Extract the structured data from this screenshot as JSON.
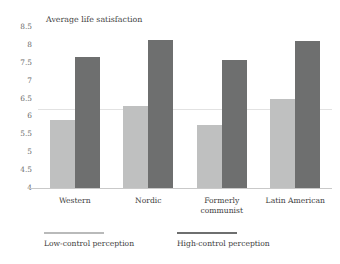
{
  "chart_data": {
    "type": "bar",
    "title": "Average life satisfaction",
    "xlabel": "",
    "ylabel": "",
    "ylim": [
      4,
      8.5
    ],
    "yticks": [
      "4",
      "4.5",
      "5",
      "5.5",
      "6",
      "6.5",
      "7",
      "7.5",
      "8",
      "8.5"
    ],
    "ytick_values": [
      4,
      4.5,
      5,
      5.5,
      6,
      6.5,
      7,
      7.5,
      8,
      8.5
    ],
    "grid": false,
    "reference_lines": [
      6.2
    ],
    "legend_position": "bottom-left",
    "categories": [
      "Western",
      "Nordic",
      "Formerly communist",
      "Latin American"
    ],
    "category_lines": [
      [
        "Western"
      ],
      [
        "Nordic"
      ],
      [
        "Formerly",
        "communist"
      ],
      [
        "Latin American"
      ]
    ],
    "series": [
      {
        "name": "Low-control perception",
        "color": "#bfc0c0",
        "values": [
          5.9,
          6.28,
          5.75,
          6.48
        ]
      },
      {
        "name": "High-control perception",
        "color": "#6e6f6f",
        "values": [
          7.67,
          8.15,
          7.58,
          8.12
        ]
      }
    ]
  },
  "legend": {
    "items": [
      {
        "label": "Low-control perception",
        "color": "#bfc0c0"
      },
      {
        "label": "High-control perception",
        "color": "#6e6f6f"
      }
    ]
  }
}
